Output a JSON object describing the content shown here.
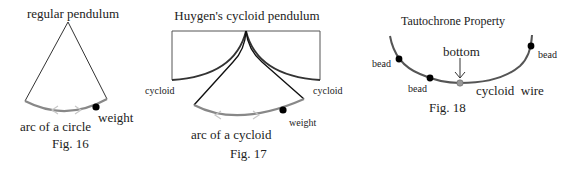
{
  "colors": {
    "line": "#333333",
    "arc": "#888888",
    "arrow": "#c8c8c8",
    "weight": "#000000",
    "bottom_marker": "#999999",
    "box": "#555555"
  },
  "figures": [
    {
      "id": "fig16",
      "title": "regular pendulum",
      "arc_label": "arc of a circle",
      "weight_label": "weight",
      "caption": "Fig. 16"
    },
    {
      "id": "fig17",
      "title": "Huygen's cycloid pendulum",
      "cycloid_left_label": "cycloid",
      "cycloid_right_label": "cycloid",
      "arc_label": "arc of a cycloid",
      "weight_label": "weight",
      "caption": "Fig. 17"
    },
    {
      "id": "fig18",
      "title": "Tautochrone Property",
      "bottom_label": "bottom",
      "wire_label": "cycloid  wire",
      "bead_labels": [
        "bead",
        "bead",
        "bead"
      ],
      "caption": "Fig. 18"
    }
  ]
}
